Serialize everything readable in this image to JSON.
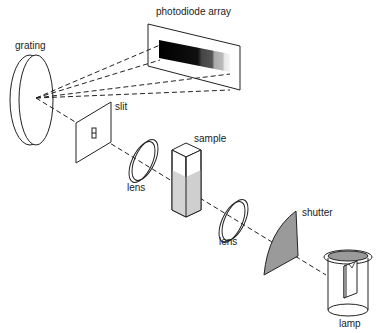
{
  "diagram": {
    "type": "spectrophotometer optical path schematic",
    "labels": {
      "photodiode_array": "photodiode array",
      "grating": "grating",
      "slit": "slit",
      "sample": "sample",
      "lens1": "lens",
      "lens2": "lens",
      "shutter": "shutter",
      "lamp": "lamp"
    },
    "colors": {
      "line": "#222222",
      "shutter_fill": "#9a9a9a",
      "lamp_top_fill": "#9a9a9a",
      "sample_liquid": "#d4d4d4",
      "array_gradient": [
        "#000000",
        "#333333",
        "#888888",
        "#dddddd"
      ]
    }
  }
}
